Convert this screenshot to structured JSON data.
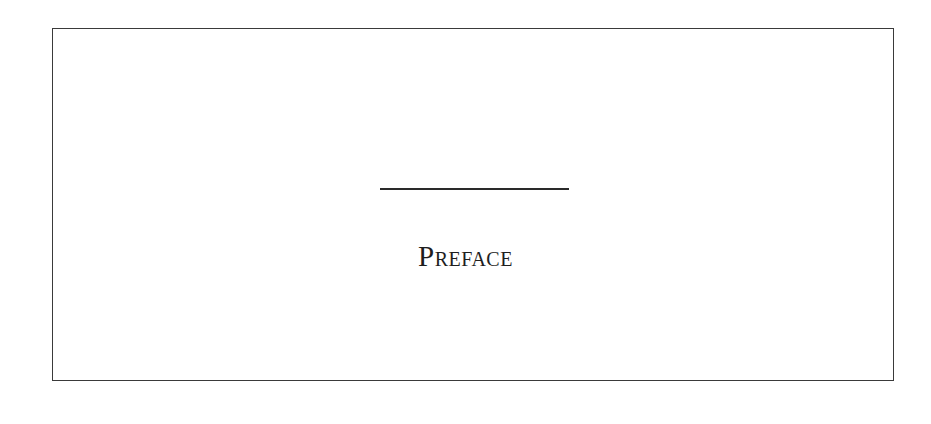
{
  "page": {
    "heading": "Preface"
  },
  "colors": {
    "text": "#1e1e1e",
    "border": "#3a3a3a",
    "rule": "#2a2a2a",
    "background": "#ffffff"
  }
}
